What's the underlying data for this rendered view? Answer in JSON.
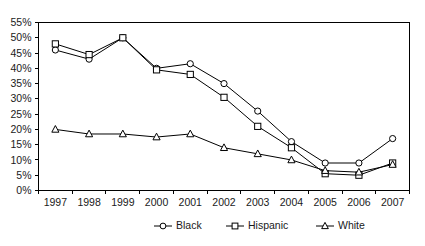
{
  "chart_data": {
    "type": "line",
    "title": "",
    "subtitle": "",
    "xlabel": "",
    "ylabel": "",
    "categories": [
      "1997",
      "1998",
      "1999",
      "2000",
      "2001",
      "2002",
      "2003",
      "2004",
      "2005",
      "2006",
      "2007"
    ],
    "x": [
      1997,
      1998,
      1999,
      2000,
      2001,
      2002,
      2003,
      2004,
      2005,
      2006,
      2007
    ],
    "series": [
      {
        "name": "Black",
        "marker": "circle",
        "color": "#000000",
        "values": [
          46,
          43,
          50,
          40,
          41.5,
          35,
          26,
          16,
          9,
          9,
          17
        ]
      },
      {
        "name": "Hispanic",
        "marker": "square",
        "color": "#000000",
        "values": [
          48,
          44.5,
          50,
          39.5,
          38,
          30.5,
          21,
          14,
          5.5,
          5,
          9
        ]
      },
      {
        "name": "White",
        "marker": "triangle",
        "color": "#000000",
        "values": [
          20,
          18.5,
          18.5,
          17.5,
          18.5,
          14,
          12,
          10,
          6.5,
          6,
          8.5
        ]
      }
    ],
    "ylim": [
      0,
      55
    ],
    "ytick_values": [
      0,
      5,
      10,
      15,
      20,
      25,
      30,
      35,
      40,
      45,
      50,
      55
    ],
    "ytick_labels": [
      "0%",
      "5%",
      "10%",
      "15%",
      "20%",
      "25%",
      "30%",
      "35%",
      "40%",
      "45%",
      "50%",
      "55%"
    ],
    "value_suffix": "%",
    "grid": false,
    "legend_position": "bottom",
    "legend_entries": [
      "Black",
      "Hispanic",
      "White"
    ]
  },
  "axes": {
    "y_ticks": [
      "55%",
      "50%",
      "45%",
      "40%",
      "35%",
      "30%",
      "25%",
      "20%",
      "15%",
      "10%",
      "5%",
      "0%"
    ],
    "x_ticks": [
      "1997",
      "1998",
      "1999",
      "2000",
      "2001",
      "2002",
      "2003",
      "2004",
      "2005",
      "2006",
      "2007"
    ]
  },
  "legend": {
    "items": [
      {
        "label": "Black",
        "marker": "circle"
      },
      {
        "label": "Hispanic",
        "marker": "square"
      },
      {
        "label": "White",
        "marker": "triangle"
      }
    ]
  }
}
